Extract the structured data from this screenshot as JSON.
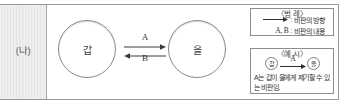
{
  "figure": {
    "panel_label": "(나)",
    "diagram": {
      "left_actor": "갑",
      "right_actor": "을",
      "arrow_forward_label": "A",
      "arrow_backward_label": "B",
      "arrow_forward_icon": "arrow-right-icon",
      "arrow_backward_icon": "arrow-left-icon"
    },
    "legend": {
      "title": "〈범 례〉",
      "rows": [
        {
          "key": "⟶",
          "key_type": "arrow-right-icon",
          "separator": ":",
          "description": "비판의 방향"
        },
        {
          "key": "A, B",
          "key_type": "text",
          "separator": ":",
          "description": "비판의 내용"
        }
      ]
    },
    "example": {
      "title": "〈예 시〉",
      "mini_left_actor": "갑",
      "mini_right_actor": "을",
      "mini_arrow_label": "A",
      "caption": "A는 갑이 을에게 제기할 수 있는 비판임."
    }
  },
  "colors": {
    "frame_border": "#9a9a9a",
    "circle_stroke": "#8b8b8b",
    "box_border": "#8d8d8d",
    "panel_hatch": "#e4e4e4",
    "text": "#2f2f2f"
  }
}
